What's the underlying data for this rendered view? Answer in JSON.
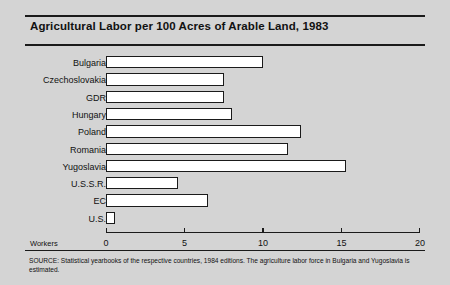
{
  "figure": {
    "background_color": "#d4d4d4",
    "ink_color": "#1a1a1a",
    "bar_fill_color": "#ffffff"
  },
  "title": "Agricultural Labor per 100 Acres of Arable Land, 1983",
  "axis_name": "Workers",
  "source_note": "SOURCE: Statistical yearbooks of the respective countries, 1984 editions. The agriculture labor force in Bulgaria and Yugoslavia is estimated.",
  "chart_data": {
    "type": "bar",
    "orientation": "horizontal",
    "title": "Agricultural Labor per 100 Acres of Arable Land, 1983",
    "xlabel": "Workers",
    "ylabel": "",
    "categories": [
      "Bulgaria",
      "Czechoslovakia",
      "GDR",
      "Hungary",
      "Poland",
      "Romania",
      "Yugoslavia",
      "U.S.S.R.",
      "EC",
      "U.S."
    ],
    "values": [
      10.0,
      7.5,
      7.5,
      8.0,
      12.4,
      11.6,
      15.3,
      4.6,
      6.5,
      0.6
    ],
    "xlim": [
      0,
      20
    ],
    "xticks": [
      0,
      5,
      10,
      15,
      20
    ],
    "xtick_labels": [
      "0",
      "5",
      "10",
      "15",
      "20"
    ],
    "grid": false,
    "legend": false
  }
}
